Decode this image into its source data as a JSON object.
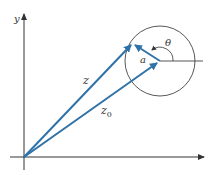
{
  "diagram": {
    "type": "complex-plane-vector",
    "labels": {
      "y_axis": "y",
      "z": "z",
      "z0": "z",
      "z0_sub": "0",
      "a": "a",
      "theta": "θ"
    },
    "colors": {
      "vector": "#2f72a8",
      "axis": "#333333",
      "circle": "#444444"
    }
  }
}
